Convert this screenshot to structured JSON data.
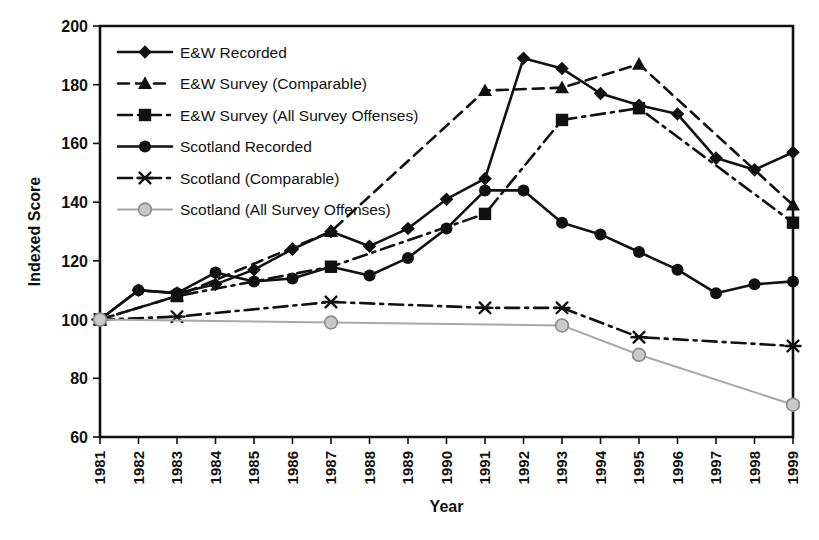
{
  "chart_data": {
    "type": "line",
    "title": "",
    "xlabel": "Year",
    "ylabel": "Indexed Score",
    "xlim": [
      1981,
      1999
    ],
    "ylim": [
      60,
      200
    ],
    "ytick_step": 20,
    "yticks": [
      60,
      80,
      100,
      120,
      140,
      160,
      180,
      200
    ],
    "categories": [
      "1981",
      "1982",
      "1983",
      "1984",
      "1985",
      "1986",
      "1987",
      "1988",
      "1989",
      "1990",
      "1991",
      "1992",
      "1993",
      "1994",
      "1995",
      "1996",
      "1997",
      "1998",
      "1999"
    ],
    "x": [
      1981,
      1982,
      1983,
      1984,
      1985,
      1986,
      1987,
      1988,
      1989,
      1990,
      1991,
      1992,
      1993,
      1994,
      1995,
      1996,
      1997,
      1998,
      1999
    ],
    "grid": false,
    "legend_position": "top-left",
    "series": [
      {
        "name": "E&W Recorded",
        "marker": "diamond",
        "line_style": "solid",
        "color": "#111111",
        "x": [
          1981,
          1982,
          1983,
          1984,
          1985,
          1986,
          1987,
          1988,
          1989,
          1990,
          1991,
          1992,
          1993,
          1994,
          1995,
          1996,
          1997,
          1998,
          1999
        ],
        "values": [
          100,
          110,
          109,
          112,
          117,
          124,
          130,
          125,
          131,
          141,
          148,
          189,
          185.5,
          177,
          173,
          170,
          155,
          151,
          157
        ]
      },
      {
        "name": "E&W Survey (Comparable)",
        "marker": "triangle",
        "line_style": "dashed",
        "color": "#111111",
        "x": [
          1981,
          1983,
          1987,
          1991,
          1993,
          1995,
          1999
        ],
        "values": [
          100,
          108,
          130,
          178,
          179,
          187,
          139
        ]
      },
      {
        "name": "E&W Survey (All Survey Offenses)",
        "marker": "square",
        "line_style": "dash-dot",
        "color": "#111111",
        "x": [
          1981,
          1983,
          1987,
          1991,
          1993,
          1995,
          1999
        ],
        "values": [
          100,
          108,
          118,
          136,
          168,
          172,
          133
        ]
      },
      {
        "name": "Scotland Recorded",
        "marker": "circle",
        "line_style": "solid",
        "color": "#111111",
        "x": [
          1981,
          1982,
          1983,
          1984,
          1985,
          1986,
          1987,
          1988,
          1989,
          1990,
          1991,
          1992,
          1993,
          1994,
          1995,
          1996,
          1997,
          1998,
          1999
        ],
        "values": [
          100,
          110,
          109,
          116,
          113,
          114,
          118,
          115,
          121,
          131,
          144,
          144,
          133,
          129,
          123,
          117,
          109,
          112,
          113
        ]
      },
      {
        "name": "Scotland (Comparable)",
        "marker": "asterisk",
        "line_style": "dash-dot",
        "color": "#111111",
        "x": [
          1981,
          1983,
          1987,
          1991,
          1993,
          1995,
          1999
        ],
        "values": [
          100,
          101,
          106,
          104,
          104,
          94,
          91
        ]
      },
      {
        "name": "Scotland (All Survey Offenses)",
        "marker": "circle-open",
        "line_style": "solid",
        "color": "#a8a8a8",
        "x": [
          1981,
          1987,
          1993,
          1995,
          1999
        ],
        "values": [
          100,
          99,
          98,
          88,
          71
        ]
      }
    ]
  },
  "legend": {
    "entries": [
      {
        "label": "E&W Recorded"
      },
      {
        "label": "E&W Survey (Comparable)"
      },
      {
        "label": "E&W Survey (All Survey Offenses)"
      },
      {
        "label": "Scotland Recorded"
      },
      {
        "label": "Scotland (Comparable)"
      },
      {
        "label": "Scotland (All Survey Offenses)"
      }
    ]
  },
  "axes": {
    "y_title": "Indexed Score",
    "x_title": "Year"
  }
}
